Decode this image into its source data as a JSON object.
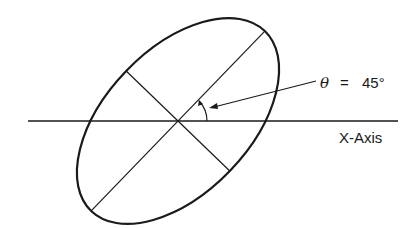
{
  "diagram": {
    "type": "rotated-ellipse",
    "theta_symbol": "θ",
    "equals": "=",
    "angle_value": "45°",
    "axis_label": "X-Axis",
    "stroke_color": "#1a1a1a",
    "background": "#ffffff"
  }
}
